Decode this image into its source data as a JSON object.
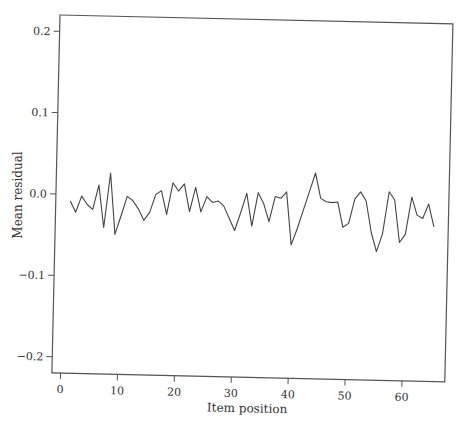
{
  "chart_data": {
    "type": "line",
    "title": "",
    "xlabel": "Item position",
    "ylabel": "Mean residual",
    "xlim": [
      -1,
      67
    ],
    "ylim": [
      -0.22,
      0.22
    ],
    "xticks": [
      0,
      10,
      20,
      30,
      40,
      50,
      60
    ],
    "xtick_labels": [
      "0",
      "10",
      "20",
      "30",
      "40",
      "50",
      "60"
    ],
    "yticks": [
      -0.2,
      -0.1,
      0.0,
      0.1,
      0.2
    ],
    "ytick_labels": [
      "−0.2",
      "−0.1",
      "0.0",
      "0.1",
      "0.2"
    ],
    "grid": false,
    "legend": null,
    "series": [
      {
        "name": "Mean residual",
        "color": "#444444",
        "x": [
          1,
          2,
          3,
          4,
          5,
          6,
          7,
          8,
          9,
          10,
          11,
          12,
          13,
          14,
          15,
          16,
          17,
          18,
          19,
          20,
          21,
          22,
          23,
          24,
          25,
          26,
          27,
          28,
          29,
          30,
          31,
          32,
          33,
          34,
          35,
          36,
          37,
          38,
          39,
          40,
          41,
          42,
          43,
          44,
          45,
          46,
          47,
          48,
          49,
          50,
          51,
          52,
          53,
          54,
          55,
          56,
          57,
          58,
          59,
          60,
          61,
          62,
          63,
          64,
          65
        ],
        "values": [
          -0.008,
          -0.022,
          -0.002,
          -0.012,
          -0.018,
          0.012,
          -0.04,
          0.027,
          -0.048,
          -0.025,
          -0.001,
          -0.006,
          -0.016,
          -0.03,
          -0.02,
          0.002,
          0.007,
          -0.022,
          0.017,
          0.007,
          0.016,
          -0.018,
          0.012,
          -0.018,
          0.001,
          -0.006,
          -0.004,
          -0.01,
          -0.025,
          -0.04,
          -0.018,
          0.006,
          -0.034,
          0.007,
          -0.006,
          -0.028,
          0.003,
          0.001,
          0.009,
          -0.056,
          -0.036,
          -0.013,
          0.01,
          0.033,
          0.002,
          -0.002,
          -0.003,
          -0.002,
          -0.033,
          -0.028,
          0.002,
          0.011,
          0.0,
          -0.038,
          -0.062,
          -0.04,
          0.012,
          0.002,
          -0.05,
          -0.04,
          0.006,
          -0.016,
          -0.02,
          -0.002,
          -0.03
        ]
      }
    ]
  }
}
